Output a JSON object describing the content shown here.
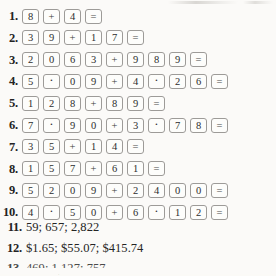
{
  "page": {
    "kind": "textbook-answer-key-page",
    "background_color": "#fbfaf8",
    "ink_color": "#2b2b2b",
    "key_border_color": "#9d9b98"
  },
  "problems": [
    {
      "number": "1.",
      "keys": [
        {
          "label": "8",
          "type": "digit"
        },
        {
          "label": "+",
          "type": "operator"
        },
        {
          "label": "4",
          "type": "digit"
        },
        {
          "label": "=",
          "type": "equals"
        }
      ]
    },
    {
      "number": "2.",
      "keys": [
        {
          "label": "3",
          "type": "digit"
        },
        {
          "label": "9",
          "type": "digit"
        },
        {
          "label": "+",
          "type": "operator"
        },
        {
          "label": "1",
          "type": "digit"
        },
        {
          "label": "7",
          "type": "digit"
        },
        {
          "label": "=",
          "type": "equals"
        }
      ]
    },
    {
      "number": "3.",
      "keys": [
        {
          "label": "2",
          "type": "digit"
        },
        {
          "label": "0",
          "type": "digit"
        },
        {
          "label": "6",
          "type": "digit"
        },
        {
          "label": "3",
          "type": "digit"
        },
        {
          "label": "+",
          "type": "operator"
        },
        {
          "label": "9",
          "type": "digit"
        },
        {
          "label": "8",
          "type": "digit"
        },
        {
          "label": "9",
          "type": "digit"
        },
        {
          "label": "=",
          "type": "equals"
        }
      ]
    },
    {
      "number": "4.",
      "keys": [
        {
          "label": "5",
          "type": "digit"
        },
        {
          "label": "·",
          "type": "decimal"
        },
        {
          "label": "0",
          "type": "digit"
        },
        {
          "label": "9",
          "type": "digit"
        },
        {
          "label": "+",
          "type": "operator"
        },
        {
          "label": "4",
          "type": "digit"
        },
        {
          "label": "·",
          "type": "decimal"
        },
        {
          "label": "2",
          "type": "digit"
        },
        {
          "label": "6",
          "type": "digit"
        },
        {
          "label": "=",
          "type": "equals"
        }
      ]
    },
    {
      "number": "5.",
      "keys": [
        {
          "label": "1",
          "type": "digit"
        },
        {
          "label": "2",
          "type": "digit"
        },
        {
          "label": "8",
          "type": "digit"
        },
        {
          "label": "+",
          "type": "operator"
        },
        {
          "label": "8",
          "type": "digit"
        },
        {
          "label": "9",
          "type": "digit"
        },
        {
          "label": "=",
          "type": "equals"
        }
      ]
    },
    {
      "number": "6.",
      "keys": [
        {
          "label": "7",
          "type": "digit"
        },
        {
          "label": "·",
          "type": "decimal"
        },
        {
          "label": "9",
          "type": "digit"
        },
        {
          "label": "0",
          "type": "digit"
        },
        {
          "label": "+",
          "type": "operator"
        },
        {
          "label": "3",
          "type": "digit"
        },
        {
          "label": "·",
          "type": "decimal"
        },
        {
          "label": "7",
          "type": "digit"
        },
        {
          "label": "8",
          "type": "digit"
        },
        {
          "label": "=",
          "type": "equals"
        }
      ]
    },
    {
      "number": "7.",
      "keys": [
        {
          "label": "3",
          "type": "digit"
        },
        {
          "label": "5",
          "type": "digit"
        },
        {
          "label": "+",
          "type": "operator"
        },
        {
          "label": "1",
          "type": "digit"
        },
        {
          "label": "4",
          "type": "digit"
        },
        {
          "label": "=",
          "type": "equals"
        }
      ]
    },
    {
      "number": "8.",
      "keys": [
        {
          "label": "1",
          "type": "digit"
        },
        {
          "label": "5",
          "type": "digit"
        },
        {
          "label": "7",
          "type": "digit"
        },
        {
          "label": "+",
          "type": "operator"
        },
        {
          "label": "6",
          "type": "digit"
        },
        {
          "label": "1",
          "type": "digit"
        },
        {
          "label": "=",
          "type": "equals"
        }
      ]
    },
    {
      "number": "9.",
      "keys": [
        {
          "label": "5",
          "type": "digit"
        },
        {
          "label": "2",
          "type": "digit"
        },
        {
          "label": "0",
          "type": "digit"
        },
        {
          "label": "9",
          "type": "digit"
        },
        {
          "label": "+",
          "type": "operator"
        },
        {
          "label": "2",
          "type": "digit"
        },
        {
          "label": "4",
          "type": "digit"
        },
        {
          "label": "0",
          "type": "digit"
        },
        {
          "label": "0",
          "type": "digit"
        },
        {
          "label": "=",
          "type": "equals"
        }
      ]
    },
    {
      "number": "10.",
      "keys": [
        {
          "label": "4",
          "type": "digit"
        },
        {
          "label": "·",
          "type": "decimal"
        },
        {
          "label": "5",
          "type": "digit"
        },
        {
          "label": "0",
          "type": "digit"
        },
        {
          "label": "+",
          "type": "operator"
        },
        {
          "label": "6",
          "type": "digit"
        },
        {
          "label": "·",
          "type": "decimal"
        },
        {
          "label": "1",
          "type": "digit"
        },
        {
          "label": "2",
          "type": "digit"
        },
        {
          "label": "=",
          "type": "equals"
        }
      ]
    }
  ],
  "answers": [
    {
      "number": "11.",
      "text": "59; 657; 2,822"
    },
    {
      "number": "12.",
      "text": "$1.65; $55.07; $415.74"
    },
    {
      "number": "13.",
      "text": "469; 1,127; 757"
    }
  ]
}
